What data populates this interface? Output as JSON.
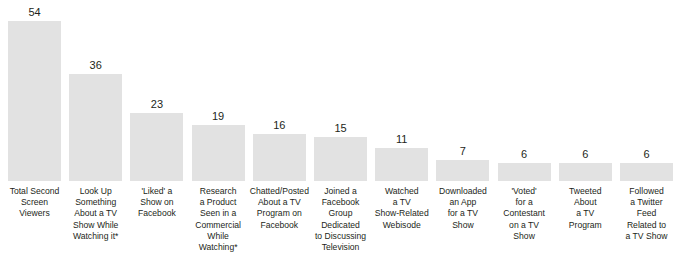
{
  "chart_data": {
    "type": "bar",
    "title": "",
    "subtitle": "",
    "xlabel": "",
    "ylabel": "",
    "ylim": [
      0,
      54
    ],
    "grid": false,
    "legend": false,
    "orientation": "vertical",
    "bar_color": "#e2e2e2",
    "value_label_color": "#231f20",
    "categories": [
      "Total Second Screen Viewers",
      "Look Up Something About a TV Show While Watching it*",
      "'Liked' a Show on Facebook",
      "Research a Product Seen in a Commercial While Watching*",
      "Chatted/Posted About a TV Program on Facebook",
      "Joined a Facebook Group Dedicated to Discussing Television",
      "Watched a TV Show-Related Webisode",
      "Downloaded an App for a TV Show",
      "'Voted' for a Contestant on a TV Show",
      "Tweeted About a TV Program",
      "Followed a Twitter Feed Related to a TV Show"
    ],
    "values": [
      54,
      36,
      23,
      19,
      16,
      15,
      11,
      7,
      6,
      6,
      6
    ],
    "bars": [
      {
        "value": 54,
        "value_label": "54",
        "label_lines": [
          "Total Second",
          "Screen",
          "Viewers"
        ]
      },
      {
        "value": 36,
        "value_label": "36",
        "label_lines": [
          "Look Up",
          "Something",
          "About a TV",
          "Show While",
          "Watching it*"
        ]
      },
      {
        "value": 23,
        "value_label": "23",
        "label_lines": [
          "'Liked' a",
          "Show on",
          "Facebook"
        ]
      },
      {
        "value": 19,
        "value_label": "19",
        "label_lines": [
          "Research",
          "a Product",
          "Seen in a",
          "Commercial",
          "While",
          "Watching*"
        ]
      },
      {
        "value": 16,
        "value_label": "16",
        "label_lines": [
          "Chatted/Posted",
          "About a TV",
          "Program on",
          "Facebook"
        ]
      },
      {
        "value": 15,
        "value_label": "15",
        "label_lines": [
          "Joined a",
          "Facebook",
          "Group",
          "Dedicated",
          "to Discussing",
          "Television"
        ]
      },
      {
        "value": 11,
        "value_label": "11",
        "label_lines": [
          "Watched",
          "a TV",
          "Show-Related",
          "Webisode"
        ]
      },
      {
        "value": 7,
        "value_label": "7",
        "label_lines": [
          "Downloaded",
          "an App",
          "for a TV",
          "Show"
        ]
      },
      {
        "value": 6,
        "value_label": "6",
        "label_lines": [
          "'Voted'",
          "for a",
          "Contestant",
          "on a TV",
          "Show"
        ]
      },
      {
        "value": 6,
        "value_label": "6",
        "label_lines": [
          "Tweeted",
          "About",
          "a TV",
          "Program"
        ]
      },
      {
        "value": 6,
        "value_label": "6",
        "label_lines": [
          "Followed",
          "a Twitter",
          "Feed",
          "Related to",
          "a TV Show"
        ]
      }
    ]
  }
}
